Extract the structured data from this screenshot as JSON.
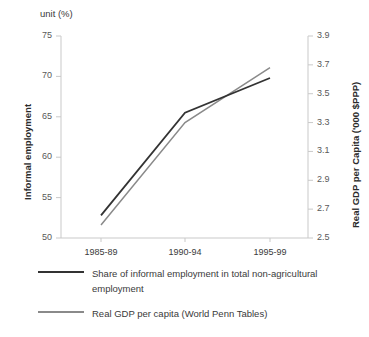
{
  "chart_data": {
    "type": "line",
    "title": "",
    "unit_note": "unit (%)",
    "categories": [
      "1985-89",
      "1990-94",
      "1995-99"
    ],
    "xlabel": "",
    "grid": false,
    "legend_position": "bottom-left",
    "series": [
      {
        "name": "Share of informal employment in total non-agricultural employment",
        "axis": "left",
        "color": "#333333",
        "values": [
          52.8,
          65.5,
          69.8
        ]
      },
      {
        "name": "Real GDP per capita (World Penn Tables)",
        "axis": "right",
        "color": "#8a8a8a",
        "values": [
          2.59,
          3.3,
          3.68
        ]
      }
    ],
    "left_axis": {
      "label": "Informal employment",
      "ylim": [
        50,
        75
      ],
      "ticks": [
        "50",
        "55",
        "60",
        "65",
        "70",
        "75"
      ]
    },
    "right_axis": {
      "label": "Real GDP per Capita ('000 $PPP)",
      "ylim": [
        2.5,
        3.9
      ],
      "ticks": [
        "2.5",
        "2.7",
        "2.9",
        "3.1",
        "3.3",
        "3.5",
        "3.7",
        "3.9"
      ]
    }
  },
  "legend": {
    "items": [
      {
        "label": "Share of informal employment in total non-agricultural employment",
        "color": "#333333"
      },
      {
        "label": "Real GDP per capita (World Penn Tables)",
        "color": "#8a8a8a"
      }
    ]
  },
  "colors": {
    "series_dark": "#333333",
    "series_light": "#8a8a8a",
    "axis": "#c9c9c9",
    "text": "#3a3a3a"
  }
}
